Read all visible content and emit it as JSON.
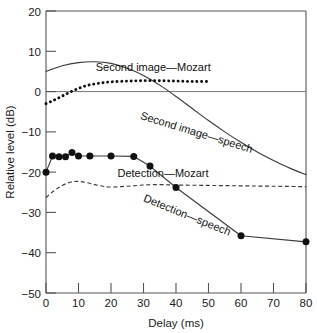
{
  "chart_data": {
    "type": "line",
    "title": "",
    "xlabel": "Delay (ms)",
    "ylabel": "Relative level (dB)",
    "xlim": [
      0,
      80
    ],
    "ylim": [
      -50,
      20
    ],
    "xticks": [
      0,
      10,
      20,
      30,
      40,
      50,
      60,
      70,
      80
    ],
    "yticks": [
      20,
      10,
      0,
      -10,
      -20,
      -30,
      -40,
      -50
    ],
    "xticklabels": [
      "0",
      "10",
      "20",
      "30",
      "40",
      "50",
      "60",
      "70",
      "80"
    ],
    "yticklabels": [
      "20",
      "10",
      "0",
      "−10",
      "−20",
      "−30",
      "−40",
      "−50"
    ],
    "grid": false,
    "legend_position": "inline-annotations",
    "zero_reference_line": 0,
    "series": [
      {
        "name": "Second image—speech",
        "style": "solid-line",
        "markers": false,
        "label_text": "Second image—speech",
        "label_x": 46,
        "label_y": -11,
        "label_rotation": 17,
        "x": [
          0,
          5,
          10,
          15,
          20,
          25,
          30,
          35,
          40,
          45,
          50,
          55,
          60,
          65,
          70,
          75,
          80
        ],
        "y": [
          5.0,
          6.4,
          7.2,
          7.4,
          7.0,
          5.8,
          4.0,
          1.6,
          -1.2,
          -4.2,
          -7.2,
          -10.0,
          -12.6,
          -15.0,
          -17.1,
          -19.0,
          -20.6
        ]
      },
      {
        "name": "Second image—Mozart",
        "style": "thick-dotted-line",
        "markers": false,
        "label_text": "Second image—Mozart",
        "label_x": 33,
        "label_y": 5.2,
        "label_rotation": 0,
        "x": [
          0,
          2.5,
          5,
          7.5,
          10,
          12.5,
          15,
          17.5,
          20,
          25,
          30,
          35,
          40,
          45,
          50
        ],
        "y": [
          -3.0,
          -2.1,
          -1.1,
          -0.1,
          0.8,
          1.5,
          1.9,
          2.2,
          2.4,
          2.6,
          2.7,
          2.7,
          2.6,
          2.5,
          2.5
        ]
      },
      {
        "name": "Detection—Mozart",
        "style": "dashed-line",
        "markers": false,
        "label_text": "Detection—Mozart",
        "label_x": 36,
        "label_y": -21.2,
        "label_rotation": 0,
        "x": [
          0,
          2.5,
          5,
          7.5,
          10,
          12.5,
          15,
          17.5,
          20,
          25,
          30,
          35,
          40,
          50,
          60,
          70,
          80
        ],
        "y": [
          -26.3,
          -24.6,
          -23.3,
          -22.5,
          -22.3,
          -22.6,
          -23.1,
          -23.5,
          -23.7,
          -23.5,
          -23.2,
          -23.1,
          -23.2,
          -23.3,
          -23.4,
          -23.5,
          -23.6
        ]
      },
      {
        "name": "Detection—speech",
        "style": "solid-line-with-markers",
        "markers": true,
        "label_text": "Detection—speech",
        "label_x": 43,
        "label_y": -31.5,
        "label_rotation": 22,
        "x": [
          0,
          2,
          4,
          6,
          8,
          10,
          13.5,
          20,
          27,
          32,
          40,
          60,
          80
        ],
        "y": [
          -20.0,
          -16.0,
          -16.2,
          -16.2,
          -15.1,
          -16.0,
          -16.0,
          -16.0,
          -16.1,
          -18.5,
          -23.8,
          -35.8,
          -37.3
        ]
      }
    ]
  },
  "axes": {
    "x_axis_title": "Delay (ms)",
    "y_axis_title": "Relative level (dB)"
  }
}
